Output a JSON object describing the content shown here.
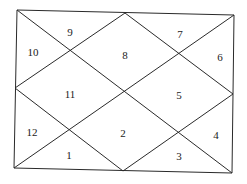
{
  "diagram": {
    "type": "north-indian-horoscope-chart",
    "line_color": "#2a2a2a",
    "background": "#ffffff",
    "houses": [
      {
        "label": "1",
        "x": 69,
        "y": 156
      },
      {
        "label": "2",
        "x": 123,
        "y": 134
      },
      {
        "label": "3",
        "x": 179,
        "y": 157
      },
      {
        "label": "4",
        "x": 216,
        "y": 136
      },
      {
        "label": "5",
        "x": 179,
        "y": 96
      },
      {
        "label": "6",
        "x": 220,
        "y": 58
      },
      {
        "label": "7",
        "x": 180,
        "y": 35
      },
      {
        "label": "8",
        "x": 125,
        "y": 56
      },
      {
        "label": "9",
        "x": 70,
        "y": 33
      },
      {
        "label": "10",
        "x": 33,
        "y": 53
      },
      {
        "label": "11",
        "x": 70,
        "y": 95
      },
      {
        "label": "12",
        "x": 32,
        "y": 133
      }
    ]
  }
}
